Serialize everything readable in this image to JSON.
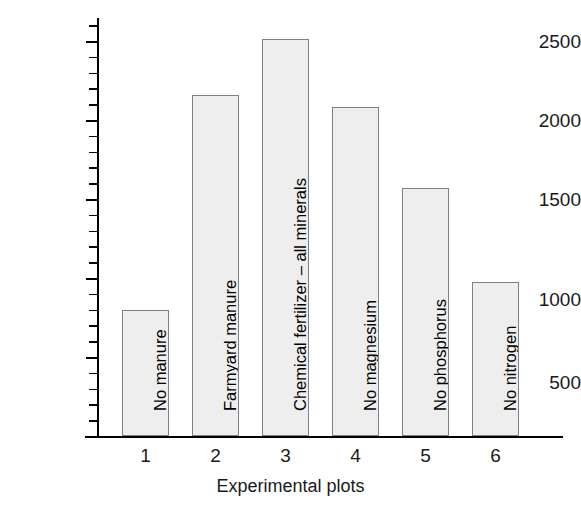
{
  "chart_data": {
    "type": "bar",
    "title": "",
    "xlabel": "Experimental plots",
    "ylabel": "Yield (kg per hectare)",
    "categories": [
      "1",
      "2",
      "3",
      "4",
      "5",
      "6"
    ],
    "bar_labels": [
      "No manure",
      "Farmyard manure",
      "Chemical fertilizer – all minerals",
      "No magnesium",
      "No phosphorus",
      "No nitrogen"
    ],
    "values": [
      800,
      2160,
      2510,
      2085,
      1570,
      975
    ],
    "ylim": [
      0,
      2700
    ],
    "ytick_major": [
      500,
      1000,
      1500,
      2000,
      2500
    ],
    "ytick_major_labels": [
      "500",
      "1000",
      "1500",
      "2000",
      "2500"
    ],
    "ytick_minor_step": 100,
    "grid": false,
    "legend": "none",
    "bar_fill_color": "#eeeeee",
    "bar_edge_color": "#808080",
    "axis_color": "#000000"
  }
}
